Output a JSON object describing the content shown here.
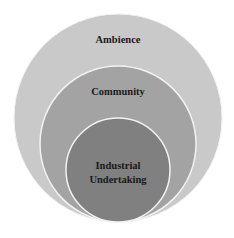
{
  "diagram": {
    "type": "nested-circles",
    "layers": [
      {
        "label": "Ambience",
        "fill": "#c9c9c9"
      },
      {
        "label": "Community",
        "fill": "#a3a3a3"
      },
      {
        "label_line1": "Industrial",
        "label_line2": "Undertaking",
        "fill": "#808080"
      }
    ],
    "stroke": "#f2f2f2"
  }
}
